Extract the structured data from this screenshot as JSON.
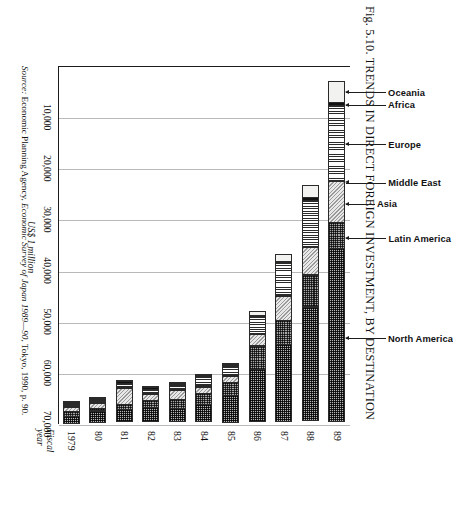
{
  "figure": {
    "number": "Fig. 5.10.",
    "title": "Fig. 5.10. TRENDS IN DIRECT FOREIGN INVESTMENT,  BY DESTINATION",
    "source_lead": "Source:",
    "source_body": " Economic Planning Agency, ",
    "source_italic": "Economic Survey of Japan 1989—90",
    "source_tail": ", Tokyo, 1990, p. 90."
  },
  "axes": {
    "value_axis_label": "US$ 1 million",
    "category_axis_label_line1": "Fiscal",
    "category_axis_label_line2": "year",
    "value_ticks": [
      "10,000",
      "20,000",
      "30,000",
      "40,000",
      "50,000",
      "60,000",
      "70,000"
    ],
    "value_min": 0,
    "value_max": 70000
  },
  "chart_data": {
    "type": "bar",
    "orientation": "horizontal-stacked",
    "title": "Fig. 5.10. TRENDS IN DIRECT FOREIGN INVESTMENT,  BY DESTINATION",
    "xlabel": "US$ 1 million",
    "ylabel": "Fiscal year",
    "xlim": [
      0,
      70000
    ],
    "xticks": [
      10000,
      20000,
      30000,
      40000,
      50000,
      60000,
      70000
    ],
    "xticklabels": [
      "10,000",
      "20,000",
      "30,000",
      "40,000",
      "50,000",
      "60,000",
      "70,000"
    ],
    "grid": "vertical",
    "legend": "callout-annotations-on-top-bar",
    "categories": [
      "1979",
      "80",
      "81",
      "82",
      "83",
      "84",
      "85",
      "86",
      "87",
      "88",
      "89"
    ],
    "series": [
      {
        "name": "North America",
        "pattern": "dense-crosshatch-dark",
        "values": [
          1438,
          2355,
          2524,
          2905,
          2701,
          3544,
          5496,
          10442,
          15357,
          22328,
          33902
        ]
      },
      {
        "name": "Latin America",
        "pattern": "mid-crosshatch",
        "values": [
          1207,
          588,
          1181,
          1503,
          1878,
          2290,
          2616,
          4737,
          4816,
          6428,
          5238
        ]
      },
      {
        "name": "Asia",
        "pattern": "diagonal-grey",
        "values": [
          975,
          1186,
          3338,
          1384,
          1847,
          1435,
          1435,
          2327,
          4868,
          5569,
          8238
        ]
      },
      {
        "name": "Middle East",
        "pattern": "fine-dot-light",
        "values": [
          151,
          158,
          96,
          84,
          175,
          273,
          45,
          44,
          62,
          259,
          66
        ]
      },
      {
        "name": "Europe",
        "pattern": "vertical-stripe",
        "values": [
          495,
          578,
          798,
          876,
          990,
          1937,
          1930,
          3469,
          6576,
          9116,
          14808
        ]
      },
      {
        "name": "Africa",
        "pattern": "solid-black",
        "values": [
          162,
          139,
          573,
          489,
          364,
          326,
          172,
          309,
          272,
          653,
          671
        ]
      },
      {
        "name": "Oceania",
        "pattern": "blank-white",
        "values": [
          168,
          448,
          324,
          423,
          364,
          157,
          525,
          992,
          1413,
          2669,
          4256
        ]
      }
    ],
    "totals": [
      4596,
      5452,
      8834,
      7664,
      8319,
      9962,
      12219,
      22320,
      33364,
      47022,
      67179
    ],
    "annotations": [
      {
        "label": "Oceania",
        "segment": "Oceania",
        "on_bar": "89"
      },
      {
        "label": "Africa",
        "segment": "Africa",
        "on_bar": "89"
      },
      {
        "label": "Europe",
        "segment": "Europe",
        "on_bar": "89"
      },
      {
        "label": "Middle East",
        "segment": "Middle East",
        "on_bar": "89"
      },
      {
        "label": "Asia",
        "segment": "Asia",
        "on_bar": "89"
      },
      {
        "label": "Latin America",
        "segment": "Latin America",
        "on_bar": "89"
      },
      {
        "label": "North America",
        "segment": "North America",
        "on_bar": "89"
      }
    ]
  }
}
